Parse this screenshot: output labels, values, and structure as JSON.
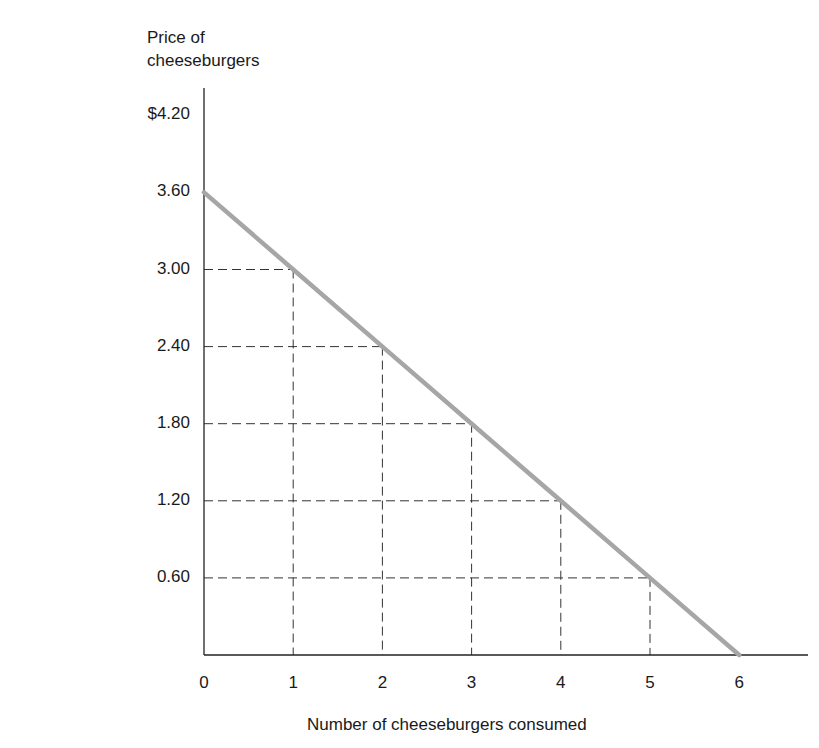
{
  "chart_data": {
    "type": "line",
    "title": "",
    "ylabel": "Price of cheeseburgers",
    "xlabel": "Number of cheeseburgers consumed",
    "x_ticks": [
      "0",
      "1",
      "2",
      "3",
      "4",
      "5",
      "6"
    ],
    "y_ticks": [
      "$4.20",
      "3.60",
      "3.00",
      "2.40",
      "1.80",
      "1.20",
      "0.60"
    ],
    "xlim": [
      0,
      6.8
    ],
    "ylim": [
      0,
      4.5
    ],
    "grid": false,
    "legend": null,
    "series": [
      {
        "name": "Demand curve",
        "color": "#a6a6a6",
        "x": [
          0,
          1,
          2,
          3,
          4,
          5,
          6
        ],
        "y": [
          3.6,
          3.0,
          2.4,
          1.8,
          1.2,
          0.6,
          0.0
        ]
      }
    ],
    "reference_lines": "Dashed lines from each point (1,3.00),(2,2.40),(3,1.80),(4,1.20),(5,0.60) to both axes"
  },
  "axes": {
    "y_title_line1": "Price of",
    "y_title_line2": "cheeseburgers",
    "x_title": "Number of cheeseburgers consumed"
  }
}
